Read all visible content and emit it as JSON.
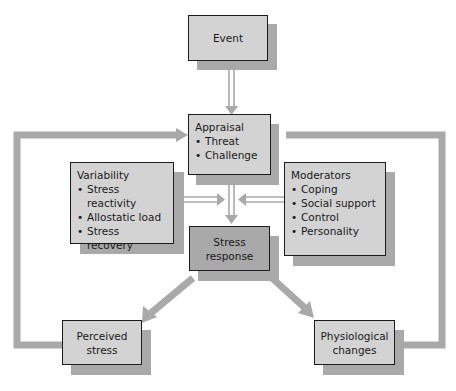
{
  "diagram": {
    "colors": {
      "light_box": "#d3d3d3",
      "dark_box": "#a9a9a9",
      "shadow": "#a9a9a9",
      "connector": "#a9a9a9",
      "border": "#1c1c1c"
    },
    "nodes": {
      "event": {
        "label": "Event"
      },
      "appraisal": {
        "title": "Appraisal",
        "items": [
          "Threat",
          "Challenge"
        ]
      },
      "variability": {
        "title": "Variability",
        "items": [
          "Stress reactivity",
          "Allostatic load",
          "Stress recovery"
        ]
      },
      "moderators": {
        "title": "Moderators",
        "items": [
          "Coping",
          "Social support",
          "Control",
          "Personality"
        ]
      },
      "stress_response": {
        "line1": "Stress",
        "line2": "response"
      },
      "perceived_stress": {
        "line1": "Perceived",
        "line2": "stress"
      },
      "physiological_changes": {
        "line1": "Physiological",
        "line2": "changes"
      }
    },
    "edges": [
      {
        "from": "Event",
        "to": "Appraisal"
      },
      {
        "from": "Appraisal",
        "to": "Stress response"
      },
      {
        "from": "Variability",
        "to": "Stress response"
      },
      {
        "from": "Moderators",
        "to": "Stress response"
      },
      {
        "from": "Stress response",
        "to": "Perceived stress"
      },
      {
        "from": "Stress response",
        "to": "Physiological changes"
      },
      {
        "from": "Perceived stress",
        "to": "Appraisal"
      },
      {
        "from": "Physiological changes",
        "to": "Appraisal"
      }
    ]
  }
}
